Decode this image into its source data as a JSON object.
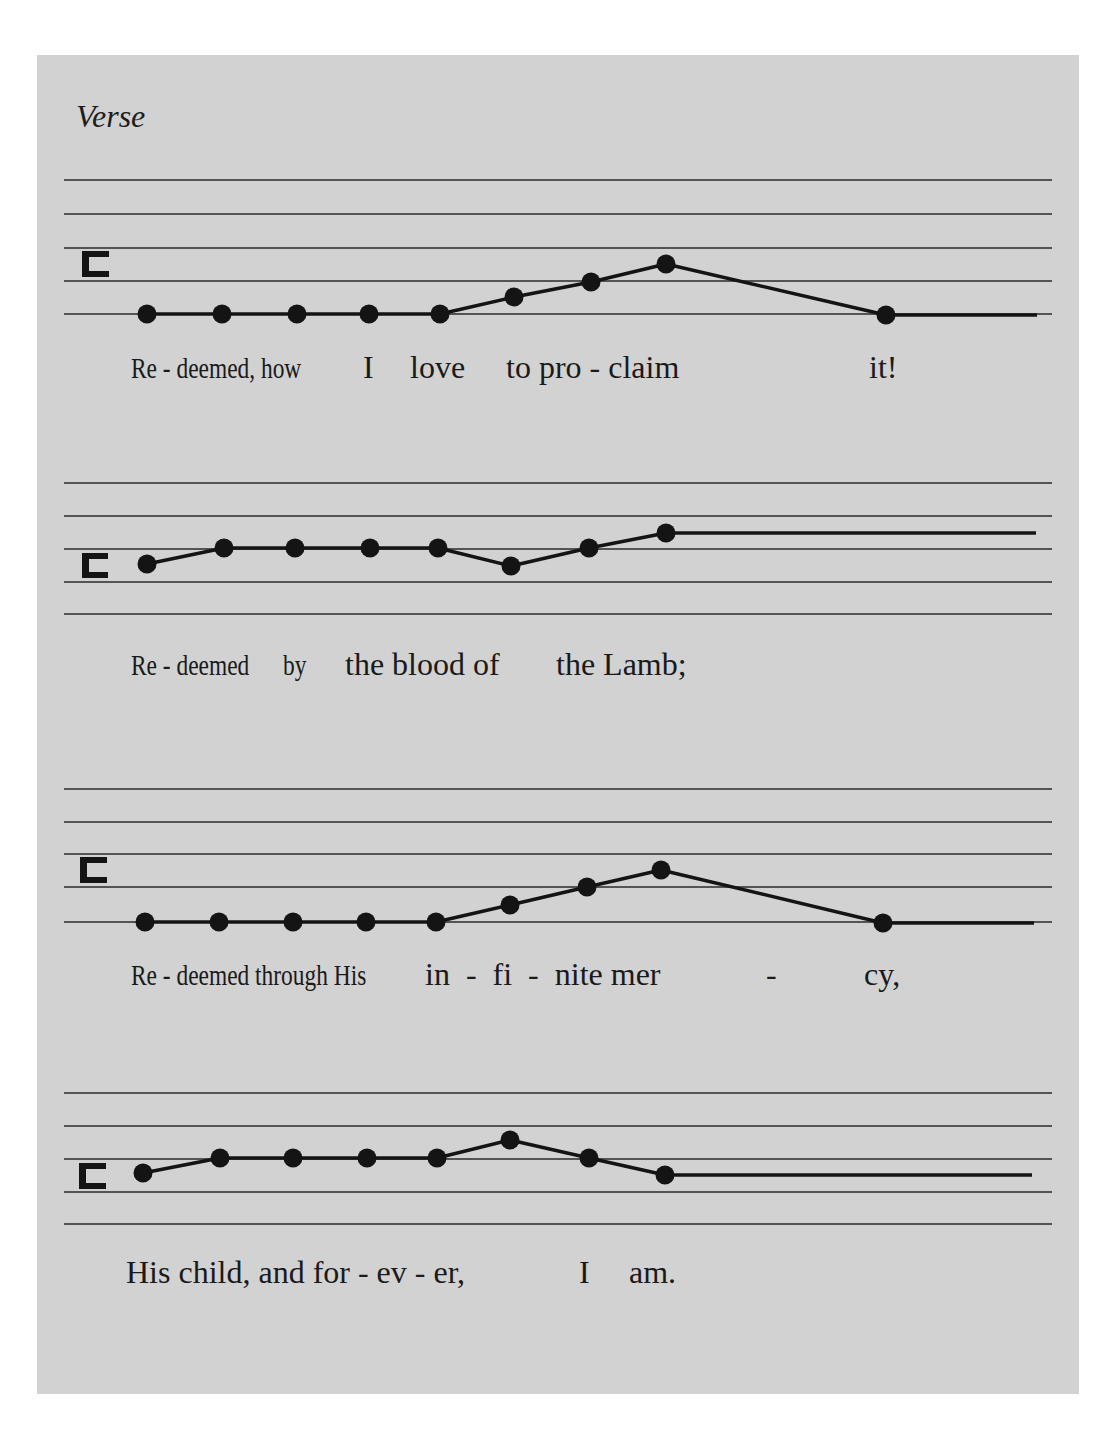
{
  "title": "Verse",
  "colors": {
    "sheet": "#d2d2d2",
    "ink": "#141414",
    "page": "#ffffff"
  },
  "staves": [
    {
      "lines_y": [
        180,
        214,
        248,
        281,
        314
      ],
      "clef": {
        "symbol": "C",
        "x": 82,
        "y": 251,
        "w": 27,
        "h": 26
      },
      "notes": [
        [
          147,
          314
        ],
        [
          222,
          314
        ],
        [
          297,
          314
        ],
        [
          369,
          314
        ],
        [
          440,
          314
        ],
        [
          514,
          297
        ],
        [
          591,
          282
        ],
        [
          666,
          264
        ],
        [
          886,
          315
        ]
      ],
      "extension_to": 1037,
      "lyrics": [
        {
          "text": "Re - deemed, how",
          "x": 131,
          "y": 383,
          "size": 30,
          "cond": 0.78
        },
        {
          "text": "I",
          "x": 363,
          "y": 383,
          "size": 32
        },
        {
          "text": "love",
          "x": 410,
          "y": 383,
          "size": 32
        },
        {
          "text": "to pro - claim",
          "x": 506,
          "y": 383,
          "size": 32
        },
        {
          "text": "it!",
          "x": 869,
          "y": 383,
          "size": 32
        }
      ]
    },
    {
      "lines_y": [
        483,
        516,
        549,
        582,
        614
      ],
      "clef": {
        "symbol": "C",
        "x": 82,
        "y": 553,
        "w": 26,
        "h": 25
      },
      "notes": [
        [
          147,
          564
        ],
        [
          224,
          548
        ],
        [
          295,
          548
        ],
        [
          370,
          548
        ],
        [
          438,
          548
        ],
        [
          511,
          566
        ],
        [
          589,
          548
        ],
        [
          666,
          533
        ]
      ],
      "extension_to": 1036,
      "lyrics": [
        {
          "text": "Re - deemed",
          "x": 131,
          "y": 680,
          "size": 30,
          "cond": 0.78
        },
        {
          "text": "by",
          "x": 283,
          "y": 680,
          "size": 30,
          "cond": 0.78
        },
        {
          "text": "the blood of",
          "x": 345,
          "y": 680,
          "size": 32
        },
        {
          "text": "the Lamb;",
          "x": 556,
          "y": 680,
          "size": 32
        }
      ]
    },
    {
      "lines_y": [
        789,
        822,
        854,
        887,
        922
      ],
      "clef": {
        "symbol": "C",
        "x": 80,
        "y": 857,
        "w": 27,
        "h": 26
      },
      "notes": [
        [
          145,
          922
        ],
        [
          219,
          922
        ],
        [
          293,
          922
        ],
        [
          366,
          922
        ],
        [
          436,
          922
        ],
        [
          510,
          905
        ],
        [
          587,
          887
        ],
        [
          661,
          870
        ],
        [
          883,
          923
        ]
      ],
      "extension_to": 1034,
      "lyrics": [
        {
          "text": "Re - deemed through His",
          "x": 131,
          "y": 990,
          "size": 30,
          "cond": 0.78
        },
        {
          "text": "in  -  fi  -  nite mer",
          "x": 425,
          "y": 990,
          "size": 32
        },
        {
          "text": "-",
          "x": 766,
          "y": 990,
          "size": 32
        },
        {
          "text": "cy,",
          "x": 864,
          "y": 990,
          "size": 32
        }
      ]
    },
    {
      "lines_y": [
        1093,
        1126,
        1159,
        1192,
        1224
      ],
      "clef": {
        "symbol": "C",
        "x": 79,
        "y": 1163,
        "w": 27,
        "h": 26
      },
      "notes": [
        [
          143,
          1173
        ],
        [
          220,
          1158
        ],
        [
          293,
          1158
        ],
        [
          367,
          1158
        ],
        [
          437,
          1158
        ],
        [
          510,
          1140
        ],
        [
          589,
          1158
        ],
        [
          665,
          1175
        ]
      ],
      "extension_to": 1032,
      "lyrics": [
        {
          "text": "His child, and for - ev - er,",
          "x": 126,
          "y": 1288,
          "size": 32
        },
        {
          "text": "I",
          "x": 579,
          "y": 1288,
          "size": 32
        },
        {
          "text": "am.",
          "x": 629,
          "y": 1288,
          "size": 32
        }
      ]
    }
  ]
}
